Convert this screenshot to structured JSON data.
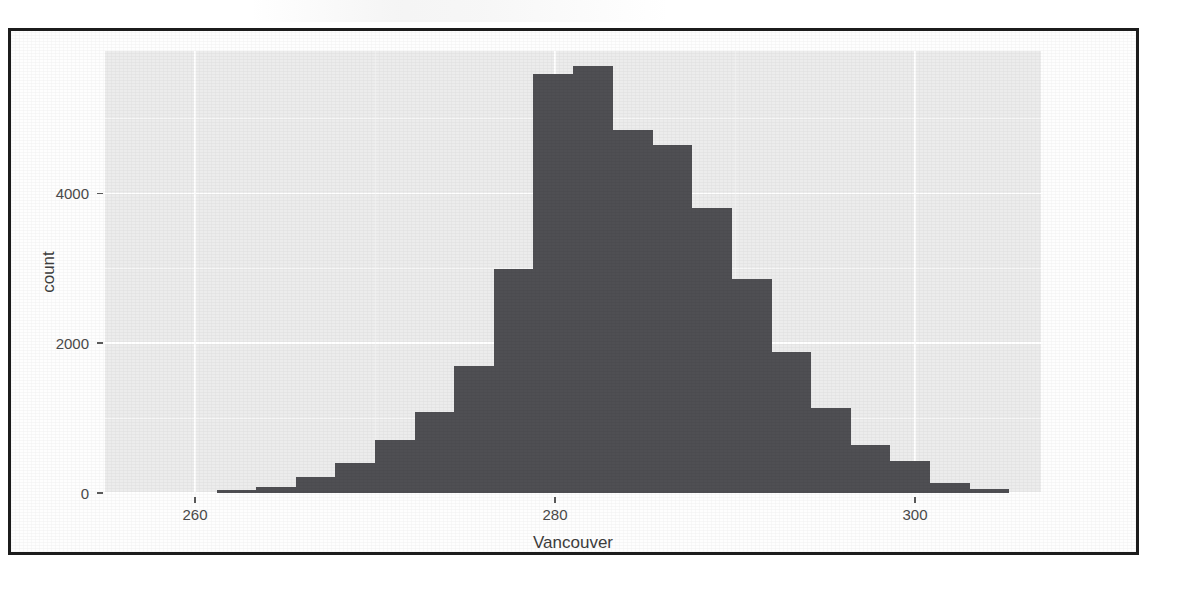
{
  "figure": {
    "kind": "histogram-figure",
    "background_color": "#ffffff",
    "frame_color": "#1c1c1c",
    "panel_color": "#ececec",
    "grid_color": "#ffffff",
    "bar_color": "#4f4f53"
  },
  "axes": {
    "x_title": "Vancouver",
    "y_title": "count",
    "x_tick_labels": [
      "260",
      "280",
      "300"
    ],
    "y_tick_labels": [
      "0",
      "2000",
      "4000"
    ]
  },
  "chart_data": {
    "type": "bar",
    "chart_subtype": "histogram",
    "title": "",
    "subtitle": "",
    "xlabel": "Vancouver",
    "ylabel": "count",
    "xlim": [
      255.0,
      307.0
    ],
    "ylim": [
      0,
      5900
    ],
    "xticks": [
      260,
      280,
      300
    ],
    "yticks": [
      0,
      2000,
      4000
    ],
    "grid": true,
    "legend": null,
    "legend_position": "none",
    "bin_width": 2.21,
    "bar_color": "#4f4f53",
    "annotations": [],
    "bins": [
      {
        "x_start": 261.2,
        "x_end": 263.4,
        "center": 262.3,
        "value": 40
      },
      {
        "x_start": 263.4,
        "x_end": 265.6,
        "center": 264.5,
        "value": 80
      },
      {
        "x_start": 265.6,
        "x_end": 267.8,
        "center": 266.7,
        "value": 210
      },
      {
        "x_start": 267.8,
        "x_end": 270.0,
        "center": 268.9,
        "value": 400
      },
      {
        "x_start": 270.0,
        "x_end": 272.2,
        "center": 271.1,
        "value": 710
      },
      {
        "x_start": 272.2,
        "x_end": 274.4,
        "center": 273.3,
        "value": 1080
      },
      {
        "x_start": 274.4,
        "x_end": 276.6,
        "center": 275.5,
        "value": 1700
      },
      {
        "x_start": 276.6,
        "x_end": 278.8,
        "center": 277.7,
        "value": 2990
      },
      {
        "x_start": 278.8,
        "x_end": 281.0,
        "center": 279.9,
        "value": 5590
      },
      {
        "x_start": 281.0,
        "x_end": 283.2,
        "center": 282.1,
        "value": 5700
      },
      {
        "x_start": 283.2,
        "x_end": 285.4,
        "center": 284.3,
        "value": 4840
      },
      {
        "x_start": 285.4,
        "x_end": 287.6,
        "center": 286.5,
        "value": 4640
      },
      {
        "x_start": 287.6,
        "x_end": 289.8,
        "center": 288.7,
        "value": 3800
      },
      {
        "x_start": 289.8,
        "x_end": 292.0,
        "center": 290.9,
        "value": 2860
      },
      {
        "x_start": 292.0,
        "x_end": 294.2,
        "center": 293.1,
        "value": 1880
      },
      {
        "x_start": 294.2,
        "x_end": 296.4,
        "center": 295.3,
        "value": 1130
      },
      {
        "x_start": 296.4,
        "x_end": 298.6,
        "center": 297.5,
        "value": 640
      },
      {
        "x_start": 298.6,
        "x_end": 300.8,
        "center": 299.7,
        "value": 430
      },
      {
        "x_start": 300.8,
        "x_end": 303.0,
        "center": 301.9,
        "value": 130
      },
      {
        "x_start": 303.0,
        "x_end": 305.2,
        "center": 304.1,
        "value": 60
      }
    ],
    "categories": [
      "262.3",
      "264.5",
      "266.7",
      "268.9",
      "271.1",
      "273.3",
      "275.5",
      "277.7",
      "279.9",
      "282.1",
      "284.3",
      "286.5",
      "288.7",
      "290.9",
      "293.1",
      "295.3",
      "297.5",
      "299.7",
      "301.9",
      "304.1"
    ],
    "values": [
      40,
      80,
      210,
      400,
      710,
      1080,
      1700,
      2990,
      5590,
      5700,
      4840,
      4640,
      3800,
      2860,
      1880,
      1130,
      640,
      430,
      130,
      60
    ]
  }
}
